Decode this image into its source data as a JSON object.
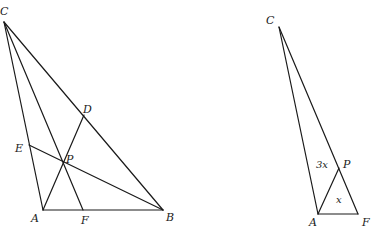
{
  "left_figure": {
    "vertices": {
      "C": {
        "label": "C",
        "x": 4,
        "y": 22
      },
      "A": {
        "label": "A",
        "x": 43,
        "y": 210
      },
      "B": {
        "label": "B",
        "x": 163,
        "y": 210
      },
      "D": {
        "label": "D",
        "x": 84,
        "y": 115
      },
      "E": {
        "label": "E",
        "x": 29,
        "y": 145
      },
      "F": {
        "label": "F",
        "x": 83,
        "y": 210
      },
      "P": {
        "label": "P",
        "x": 63,
        "y": 162
      }
    },
    "segments": [
      [
        "C",
        "A"
      ],
      [
        "C",
        "B"
      ],
      [
        "A",
        "B"
      ],
      [
        "A",
        "D"
      ],
      [
        "B",
        "E"
      ],
      [
        "C",
        "F"
      ]
    ]
  },
  "right_figure": {
    "vertices": {
      "C": {
        "label": "C",
        "x": 279,
        "y": 27
      },
      "A": {
        "label": "A",
        "x": 318,
        "y": 214
      },
      "F": {
        "label": "F",
        "x": 358,
        "y": 214
      },
      "P": {
        "label": "P",
        "x": 339,
        "y": 168
      }
    },
    "segments": [
      [
        "C",
        "A"
      ],
      [
        "C",
        "F"
      ],
      [
        "A",
        "F"
      ],
      [
        "A",
        "P"
      ]
    ],
    "area_labels": {
      "upper": "3x",
      "lower": "x"
    }
  }
}
